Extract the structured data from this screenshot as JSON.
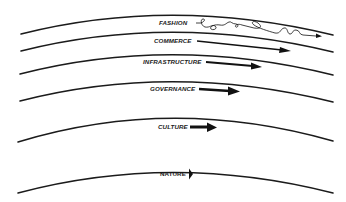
{
  "diagram": {
    "ink_color": "#1b1b1b",
    "background": "#ffffff",
    "layers": [
      {
        "name": "fashion",
        "label": "FASHION",
        "speed": "fastest",
        "arrow_style": "squiggle"
      },
      {
        "name": "commerce",
        "label": "COMMERCE",
        "speed": "fast",
        "arrow_style": "long-thin"
      },
      {
        "name": "infrastructure",
        "label": "INFRASTRUCTURE",
        "speed": "medium",
        "arrow_style": "medium"
      },
      {
        "name": "governance",
        "label": "GOVERNANCE",
        "speed": "slow",
        "arrow_style": "short-thick"
      },
      {
        "name": "culture",
        "label": "CULTURE",
        "speed": "slower",
        "arrow_style": "short-thicker"
      },
      {
        "name": "nature",
        "label": "NATURE",
        "speed": "slowest",
        "arrow_style": "head-only"
      }
    ]
  }
}
